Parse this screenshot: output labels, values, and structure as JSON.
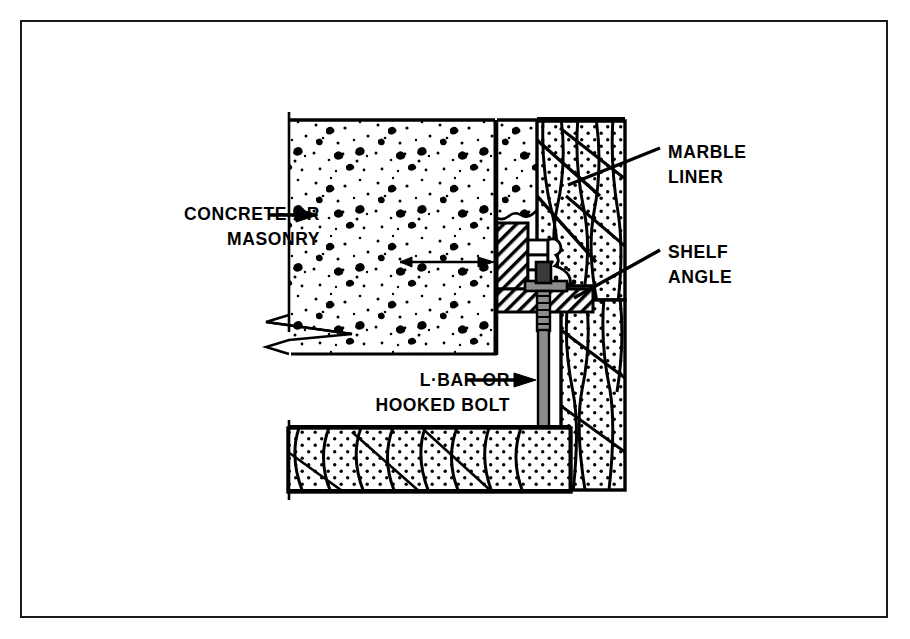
{
  "figure": {
    "type": "technical-section-drawing",
    "frame": {
      "border_color": "#1a1a1a",
      "background": "#ffffff"
    }
  },
  "labels": {
    "concrete": "CONCRETE OR\nMASONRY",
    "marble_liner": "MARBLE\nLINER",
    "shelf_angle": "SHELF\nANGLE",
    "hooked_bolt": "L·BAR OR\nHOOKED BOLT"
  },
  "leaders": {
    "concrete_arrow": "arrow-right",
    "marble_leader": "diagonal-line",
    "shelf_leader": "diagonal-line",
    "bolt_arrow": "arrow-right",
    "internal_arrow": "arrow-right"
  },
  "materials": {
    "concrete_fill": "aggregate-speckle",
    "marble_fill": "dotted-veined",
    "steel_fill": "diagonal-hatch",
    "bolt_fill": "solid-grey"
  },
  "colors": {
    "ink": "#000000",
    "paper": "#ffffff",
    "steel_hatch": "#000000",
    "bolt_grey": "#8c8c8c"
  }
}
